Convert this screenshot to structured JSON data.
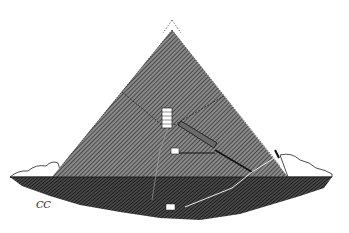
{
  "figure": {
    "signature": "CC",
    "colors": {
      "background": "#ffffff",
      "pyramid_fill": "#555555",
      "bedrock_fill": "#2a2a2a",
      "ink": "#111111"
    }
  }
}
